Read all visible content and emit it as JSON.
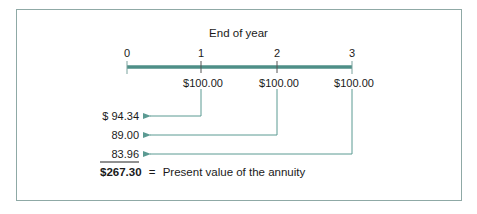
{
  "diagram": {
    "title": "End of year",
    "timeline": {
      "ticks": [
        {
          "label": "0",
          "x": 127
        },
        {
          "label": "1",
          "x": 201
        },
        {
          "label": "2",
          "x": 277
        },
        {
          "label": "3",
          "x": 352
        }
      ],
      "line_color": "#4e8f87"
    },
    "payments": [
      {
        "year": 1,
        "label": "$100.00"
      },
      {
        "year": 2,
        "label": "$100.00"
      },
      {
        "year": 3,
        "label": "$100.00"
      }
    ],
    "present_values": [
      {
        "year": 1,
        "label": "$ 94.34"
      },
      {
        "year": 2,
        "label": "89.00"
      },
      {
        "year": 3,
        "label": "83.96"
      }
    ],
    "total": {
      "value": "$267.30",
      "equals": "=",
      "description": "Present value of the annuity"
    },
    "arrow_color": "#5b9a92",
    "frame_color": "#8fa9a6"
  }
}
